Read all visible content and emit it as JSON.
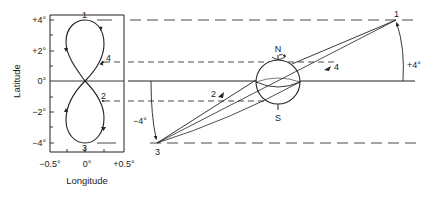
{
  "figure": {
    "left_panel": {
      "y_axis_title": "Latitude",
      "x_axis_title": "Longitude",
      "y_ticks": [
        "+4°",
        "+2°",
        "0°",
        "−2°",
        "−4°"
      ],
      "x_ticks": [
        "−0.5°",
        "0°",
        "+0.5°"
      ],
      "curve": "figure-eight (analemma) ground track",
      "points": [
        {
          "id": "1",
          "label": "1",
          "lat": "+4°",
          "lon": "0°"
        },
        {
          "id": "2",
          "label": "2",
          "lat": "−1.3°",
          "lon": "+0.2°"
        },
        {
          "id": "3",
          "label": "3",
          "lat": "−4°",
          "lon": "0°"
        },
        {
          "id": "4",
          "label": "4",
          "lat": "+1.3°",
          "lon": "+0.2°"
        }
      ]
    },
    "right_panel": {
      "globe": {
        "north_label": "N",
        "south_label": "S"
      },
      "points": [
        {
          "id": "1",
          "label": "1"
        },
        {
          "id": "2",
          "label": "2"
        },
        {
          "id": "3",
          "label": "3"
        },
        {
          "id": "4",
          "label": "4"
        }
      ],
      "angle_labels": {
        "upper": "+4°",
        "lower": "−4°"
      }
    }
  }
}
